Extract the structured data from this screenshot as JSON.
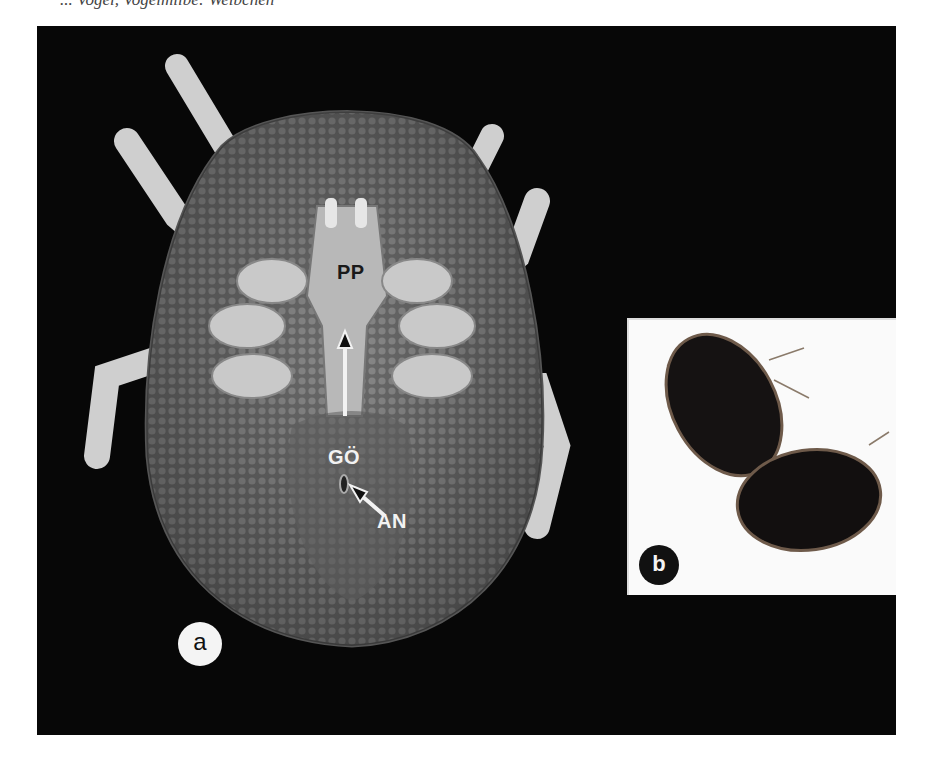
{
  "header": {
    "partial_text": "... Vogel, Vogelmilbe: Weibchen"
  },
  "figure": {
    "panel_a": {
      "panel_label": "a",
      "annotations": [
        {
          "id": "pp",
          "text": "PP"
        },
        {
          "id": "go",
          "text": "GÖ"
        },
        {
          "id": "an",
          "text": "AN"
        }
      ]
    },
    "panel_b": {
      "panel_label": "b"
    },
    "colors": {
      "background": "#070707",
      "inset_background": "#fafafa",
      "label_light": "#f2f2f2",
      "label_dark": "#1a1a1a"
    }
  }
}
